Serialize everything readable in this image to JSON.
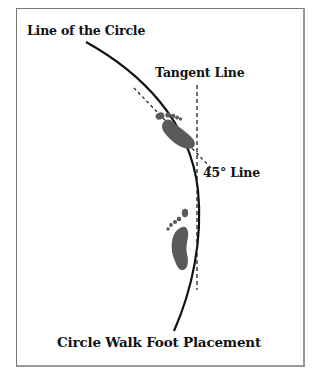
{
  "diagram": {
    "labels": {
      "circle_line": "Line of the Circle",
      "tangent_line": "Tangent Line",
      "forty_five_line": "45° Line",
      "caption": "Circle Walk Foot Placement"
    },
    "colors": {
      "ink": "#111111",
      "foot": "#5a5a5a",
      "border": "#777777"
    },
    "elements": {
      "circle_arc": "solid curved line representing the walking circle",
      "tangent": "vertical dashed line tangent to circle",
      "forty_five": "diagonal dashed line at 45 degrees",
      "feet": [
        "upper foot turned in at 45°",
        "lower foot along the circle"
      ]
    }
  }
}
